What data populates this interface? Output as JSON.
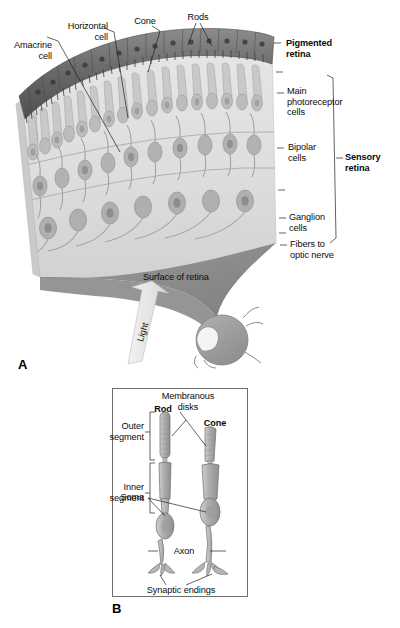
{
  "figure": {
    "background_color": "#ffffff"
  },
  "panel_a": {
    "letter": "A",
    "labels": {
      "amacrine_cell": "Amacrine\ncell",
      "horizontal_cell": "Horizontal\ncell",
      "cone": "Cone",
      "rods": "Rods",
      "pigmented_retina": "Pigmented\nretina",
      "main_photoreceptor_cells": "Main\nphotoreceptor\ncells",
      "bipolar_cells": "Bipolar\ncells",
      "ganglion_cells": "Ganglion\ncells",
      "fibers_to_optic_nerve": "Fibers to\noptic nerve",
      "sensory_retina": "Sensory\nretina",
      "surface_of_retina": "Surface of retina",
      "light": "Light"
    },
    "colors": {
      "pigment_epithelium": "#6e6e6e",
      "pigment_epithelium_dark": "#4a4a4a",
      "retina_body": "#dcdcdc",
      "retina_body_light": "#eaeaea",
      "cell_fill": "#b9b9b9",
      "cell_outline": "#8a8a8a",
      "funnel": "#8f8f8f",
      "eyeball": "#9a9a9a",
      "light_arrow": "#e2e2e2",
      "leader_line": "#2b2b2b"
    }
  },
  "panel_b": {
    "letter": "B",
    "labels": {
      "membranous_disks": "Membranous\ndisks",
      "rod": "Rod",
      "cone": "Cone",
      "outer_segment": "Outer\nsegment",
      "inner_segment": "Inner\nsegment",
      "soma": "Soma",
      "axon": "Axon",
      "synaptic_endings": "Synaptic endings"
    },
    "colors": {
      "frame_border": "#6f6f6f",
      "cell_fill": "#a8a8a8",
      "cell_fill_light": "#c6c6c6",
      "cell_outline": "#6b6b6b",
      "leader_line": "#2b2b2b"
    }
  }
}
